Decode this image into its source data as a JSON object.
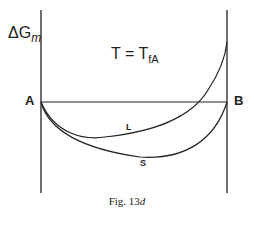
{
  "figure": {
    "y_axis_label_prefix": "ΔG",
    "y_axis_label_sub": "m",
    "condition_left": "T = T",
    "condition_sub": "fA",
    "point_left": "A",
    "point_right": "B",
    "curve_liquid_label": "L",
    "curve_solid_label": "S",
    "caption_prefix": "Fig. 13",
    "caption_suffix": "d"
  },
  "colors": {
    "line": "#222222",
    "background": "#ffffff"
  }
}
